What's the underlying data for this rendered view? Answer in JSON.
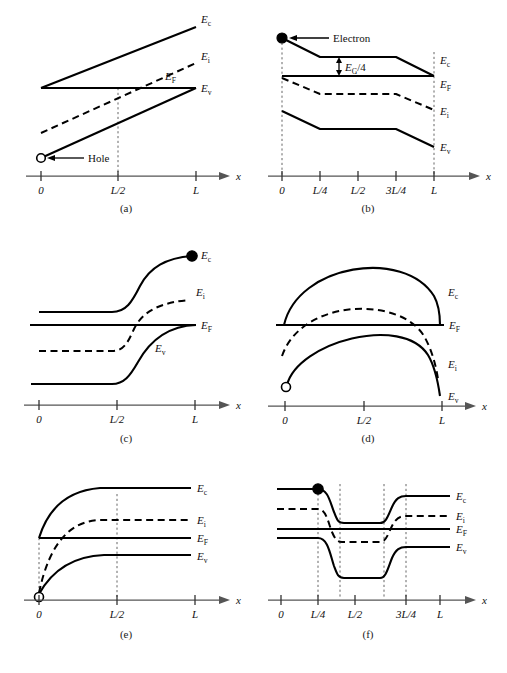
{
  "figure": {
    "background": "#ffffff",
    "ink": "#000000",
    "axis_color": "#555555",
    "panel_count": 6
  },
  "band_labels": {
    "Ec": {
      "symbol": "E",
      "sub": "c"
    },
    "Ei": {
      "symbol": "E",
      "sub": "i"
    },
    "EF": {
      "symbol": "E",
      "sub": "F"
    },
    "Ev": {
      "symbol": "E",
      "sub": "v"
    }
  },
  "axis": {
    "name": "x",
    "label": "x"
  },
  "panels": [
    {
      "id": "a",
      "caption": "(a)",
      "ticks": [
        "0",
        "L/2",
        "L"
      ],
      "guides": [
        "L/2"
      ],
      "annotations": [
        {
          "name": "hole",
          "text": "Hole",
          "marker": "open-circle",
          "at": "0"
        }
      ],
      "band_labels": [
        "Ec",
        "Ei",
        "EF",
        "Ev"
      ],
      "description": "Linearly graded bands; Ec and Ev rise linearly with x, Ei dashed rising, EF flat horizontal."
    },
    {
      "id": "b",
      "caption": "(b)",
      "ticks": [
        "0",
        "L/4",
        "L/2",
        "3L/4",
        "L"
      ],
      "guides": [
        "0",
        "L"
      ],
      "annotations": [
        {
          "name": "electron",
          "text": "Electron",
          "marker": "filled-circle",
          "at": "0"
        },
        {
          "name": "band-gap-fraction",
          "text": "EG/4",
          "symbol": "E",
          "sub": "G",
          "rest": "/4"
        }
      ],
      "band_labels": [
        "Ec",
        "EF",
        "Ei",
        "Ev"
      ],
      "description": "Stepwise graded bands descending from 0 to L; EF flat; EG/4 arrow between Ec plateau and EF."
    },
    {
      "id": "c",
      "caption": "(c)",
      "ticks": [
        "0",
        "L/2",
        "L"
      ],
      "guides": [],
      "annotations": [
        {
          "name": "electron",
          "marker": "filled-circle",
          "at": "L"
        }
      ],
      "band_labels": [
        "Ec",
        "Ei",
        "EF",
        "Ev"
      ],
      "description": "Flat bands up to L/2 then rising smoothly to a plateau; EF flat throughout."
    },
    {
      "id": "d",
      "caption": "(d)",
      "ticks": [
        "0",
        "L/2",
        "L"
      ],
      "guides": [],
      "annotations": [
        {
          "name": "hole",
          "marker": "open-circle",
          "at": "0"
        }
      ],
      "band_labels": [
        "Ec",
        "EF",
        "Ei",
        "Ev"
      ],
      "description": "Bands bow upward as arcs peaking at L/2; EF flat horizontal line."
    },
    {
      "id": "e",
      "caption": "(e)",
      "ticks": [
        "0",
        "L/2",
        "L"
      ],
      "guides": [
        "0",
        "L/2"
      ],
      "annotations": [
        {
          "name": "hole",
          "marker": "open-circle",
          "at": "0"
        }
      ],
      "band_labels": [
        "Ec",
        "Ei",
        "EF",
        "Ev"
      ],
      "description": "Bands rise steeply near x=0 then saturate to flat plateaus; EF flat."
    },
    {
      "id": "f",
      "caption": "(f)",
      "ticks": [
        "0",
        "L/4",
        "L/2",
        "3L/4",
        "L"
      ],
      "guides": [
        "L/4",
        "L/2-left",
        "L/2-right",
        "3L/4"
      ],
      "annotations": [
        {
          "name": "electron",
          "marker": "filled-circle",
          "at": "L/4"
        }
      ],
      "band_labels": [
        "Ec",
        "Ei",
        "EF",
        "Ev"
      ],
      "description": "Quantum-well style: bands drop between L/4 and 3L/4 forming a well, then return; EF flat."
    }
  ]
}
